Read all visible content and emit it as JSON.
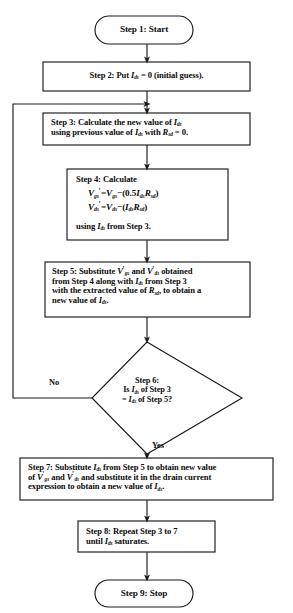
{
  "figure": {
    "type": "flowchart",
    "top_partial_text": "",
    "stroke_color": "#1a1a1a",
    "text_color": "#0d0d0d",
    "background": "#ffffff"
  },
  "nodes": {
    "step1": {
      "id": "step1",
      "shape": "terminator",
      "label": "Step 1: Start"
    },
    "step2": {
      "id": "step2",
      "shape": "process",
      "prefix": "Step 2:  Put ",
      "var": "I",
      "sub": "ds",
      "suffix": " = 0 (initial guess)."
    },
    "step3": {
      "id": "step3",
      "shape": "process",
      "line1_a": "Step 3: Calculate the new value of ",
      "line1_var": "I",
      "line1_sub": "ds",
      "line2_a": "using previous value of ",
      "line2_var": "I",
      "line2_sub": "ds",
      "line2_b": " with ",
      "line2_var2": "R",
      "line2_sub2": "sd",
      "line2_c": " = 0."
    },
    "step4": {
      "id": "step4",
      "shape": "process",
      "heading": "Step 4: Calculate",
      "equation1": {
        "lhs_var": "V",
        "lhs_sub": "gs",
        "lhs_prime": "'",
        "eq": "=",
        "rhs_var": "V",
        "rhs_sub": "gs",
        "minus": "−",
        "open": "(",
        "coeff": "0.5",
        "i_var": "I",
        "i_sub": "ds",
        "r_var": "R",
        "r_sub": "sd",
        "close": ")"
      },
      "equation2": {
        "lhs_var": "V",
        "lhs_sub": "ds",
        "lhs_prime": "'",
        "eq": "=",
        "rhs_var": "V",
        "rhs_sub": "ds",
        "minus": "−",
        "open": "(",
        "i_var": "I",
        "i_sub": "ds",
        "r_var": "R",
        "r_sub": "sd",
        "close": ")"
      },
      "footer_a": "using ",
      "footer_var": "I",
      "footer_sub": "ds",
      "footer_b": " from Step 3."
    },
    "step5": {
      "id": "step5",
      "shape": "process",
      "l1_a": "Step 5: Substitute ",
      "l1_v1": "V",
      "l1_s1": "gs",
      "l1_b": " and ",
      "l1_v2": "V",
      "l1_s2": "ds",
      "l1_c": " obtained",
      "l2_a": "from Step 4 along with ",
      "l2_v": "I",
      "l2_s": "ds",
      "l2_b": " from Step 3",
      "l3_a": "with the extracted value of ",
      "l3_v": "R",
      "l3_s": "sd",
      "l3_b": ", to obtain a",
      "l4_a": "new value of ",
      "l4_v": "I",
      "l4_s": "ds",
      "l4_b": "."
    },
    "step6": {
      "id": "step6",
      "shape": "decision",
      "l1": "Step 6:",
      "l2_a": "Is ",
      "l2_v": "I",
      "l2_s": "ds",
      "l2_b": " of Step 3",
      "l3_a": "= ",
      "l3_v": "I",
      "l3_s": "ds",
      "l3_b": " of Step 5?"
    },
    "step7": {
      "id": "step7",
      "shape": "process",
      "l1_a": "Step 7: Substitute ",
      "l1_v": "I",
      "l1_s": "ds",
      "l1_b": " from Step 5 to obtain new value",
      "l2_a": "of ",
      "l2_v1": "V",
      "l2_s1": "gs",
      "l2_b": " and ",
      "l2_v2": "V",
      "l2_s2": "ds",
      "l2_c": " and substitute it in the drain current",
      "l3_a": "expression to obtain a new value of ",
      "l3_v": "I",
      "l3_s": "ds",
      "l3_b": "."
    },
    "step8": {
      "id": "step8",
      "shape": "process",
      "l1": "Step 8: Repeat Step 3 to 7",
      "l2_a": "until ",
      "l2_v": "I",
      "l2_s": "ds",
      "l2_b": " saturates."
    },
    "step9": {
      "id": "step9",
      "shape": "terminator",
      "label": "Step 9: Stop"
    }
  },
  "edge_labels": {
    "no": "No",
    "yes": "Yes"
  }
}
